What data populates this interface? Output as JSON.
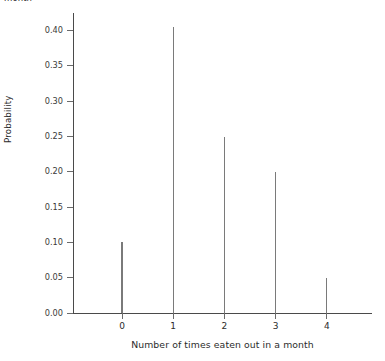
{
  "top_clipped_caption": "month",
  "chart_data": {
    "type": "bar",
    "title": "",
    "subtitle": "",
    "xlabel": "Number of times eaten out in a month",
    "ylabel": "Probability",
    "categories": [
      "0",
      "1",
      "2",
      "3",
      "4"
    ],
    "values": [
      0.1,
      0.405,
      0.25,
      0.2,
      0.05
    ],
    "series": [
      {
        "name": "Probability",
        "values": [
          0.1,
          0.405,
          0.25,
          0.2,
          0.05
        ]
      }
    ],
    "xlim": [
      -0.95,
      4.9
    ],
    "ylim": [
      0.0,
      0.425
    ],
    "y_ticks": [
      0.0,
      0.05,
      0.1,
      0.15,
      0.2,
      0.25,
      0.3,
      0.35,
      0.4
    ],
    "y_tick_labels": [
      "0.00",
      "0.05",
      "0.10",
      "0.15",
      "0.20",
      "0.25",
      "0.30",
      "0.35",
      "0.40"
    ],
    "x_ticks": [
      0,
      1,
      2,
      3,
      4
    ],
    "x_tick_labels": [
      "0",
      "1",
      "2",
      "3",
      "4"
    ],
    "grid": false,
    "legend": false,
    "legend_position": "none",
    "marker_style": "spike",
    "line_color": "#7a7a7a",
    "axis_color": "#4a4a4a",
    "background_color": "#ffffff",
    "annotations": []
  }
}
